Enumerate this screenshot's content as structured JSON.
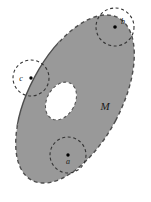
{
  "figure": {
    "kind": "manifold-with-boundary-diagram",
    "caption": "",
    "region_label": "M",
    "colors": {
      "region_fill": "#999999",
      "region_stroke": "#4d4d4d",
      "hole_fill": "#ffffff",
      "neighborhood_stroke": "#333333",
      "point_marker": "#000000",
      "background": "#ffffff",
      "label_color": "#1a1a1a"
    },
    "outer_region": {
      "shape": "ellipse",
      "center_x": 75,
      "center_y": 99,
      "radius_x": 46,
      "radius_y": 92,
      "rotation_deg": 28,
      "boundary_style_solid_arc": "upper-left",
      "boundary_style_dashed_arc": "right"
    },
    "hole": {
      "shape": "ellipse",
      "center_x": 61,
      "center_y": 101,
      "radius_x": 14,
      "radius_y": 20,
      "rotation_deg": 28,
      "boundary_style": "dashed"
    },
    "points": [
      {
        "id": "a",
        "label": "a",
        "x": 68,
        "y": 155,
        "type": "interior",
        "neighborhood_radius": 18,
        "label_dx": 0,
        "label_dy": 9
      },
      {
        "id": "b",
        "label": "b",
        "x": 115,
        "y": 27,
        "type": "boundary",
        "neighborhood_radius": 19,
        "label_dx": 7,
        "label_dy": -4
      },
      {
        "id": "c",
        "label": "c",
        "x": 31,
        "y": 78,
        "type": "boundary",
        "neighborhood_radius": 18,
        "label_dx": -10,
        "label_dy": 1
      }
    ],
    "region_label_pos": {
      "x": 105,
      "y": 110
    }
  }
}
